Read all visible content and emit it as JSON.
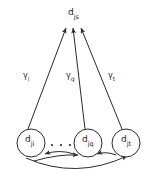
{
  "figure": {
    "type": "directed-graph-diagram",
    "background_color": "#ffffff",
    "stroke_color": "#2b2b2b",
    "text_color": "#1a1a1a"
  },
  "nodes": {
    "target": {
      "id": "d-js",
      "base": "d",
      "subscript": "js",
      "full_label": "d_js",
      "shape": "plain-text",
      "x": 73,
      "y": 16
    },
    "sources": [
      {
        "id": "d-ji",
        "base": "d",
        "subscript": "ji",
        "full_label": "d_ji",
        "shape": "circle",
        "x": 31,
        "y": 143,
        "r": 14
      },
      {
        "id": "d-jq",
        "base": "d",
        "subscript": "jq",
        "full_label": "d_jq",
        "shape": "circle",
        "x": 88,
        "y": 143,
        "r": 14
      },
      {
        "id": "d-jt",
        "base": "d",
        "subscript": "jt",
        "full_label": "d_jt",
        "shape": "circle",
        "x": 126,
        "y": 143,
        "r": 14
      }
    ]
  },
  "ellipsis": {
    "symbol": "...",
    "dot_count": 3,
    "between": [
      "d_ji",
      "d_jq"
    ]
  },
  "edges": [
    {
      "id": "edge-ji-js",
      "from": "d_ji",
      "to": "d_js",
      "style": "straight-arrow",
      "label": {
        "base": "γ",
        "subscript": "i",
        "full": "γ_i",
        "x": 26,
        "y": 79
      }
    },
    {
      "id": "edge-jq-js",
      "from": "d_jq",
      "to": "d_js",
      "style": "straight-arrow",
      "label": {
        "base": "γ",
        "subscript": "q",
        "full": "γ_q",
        "x": 69,
        "y": 79
      }
    },
    {
      "id": "edge-jt-js",
      "from": "d_jt",
      "to": "d_js",
      "style": "straight-arrow",
      "label": {
        "base": "γ",
        "subscript": "t",
        "full": "γ_t",
        "x": 111,
        "y": 79
      }
    },
    {
      "id": "edge-jq-to-ji",
      "from": "d_jq",
      "to": "d_ji",
      "style": "curved-arrow"
    },
    {
      "id": "edge-ji-to-jq",
      "from": "d_ji",
      "to": "d_jq",
      "style": "curved-arrow"
    },
    {
      "id": "edge-jq-to-jt",
      "from": "d_jq",
      "to": "d_jt",
      "style": "curved-arrow"
    },
    {
      "id": "edge-jt-to-jq",
      "from": "d_jt",
      "to": "d_jq",
      "style": "curved-arrow"
    },
    {
      "id": "edge-ji-to-jt",
      "from": "d_ji",
      "to": "d_jt",
      "style": "long-curved-arrow"
    }
  ]
}
